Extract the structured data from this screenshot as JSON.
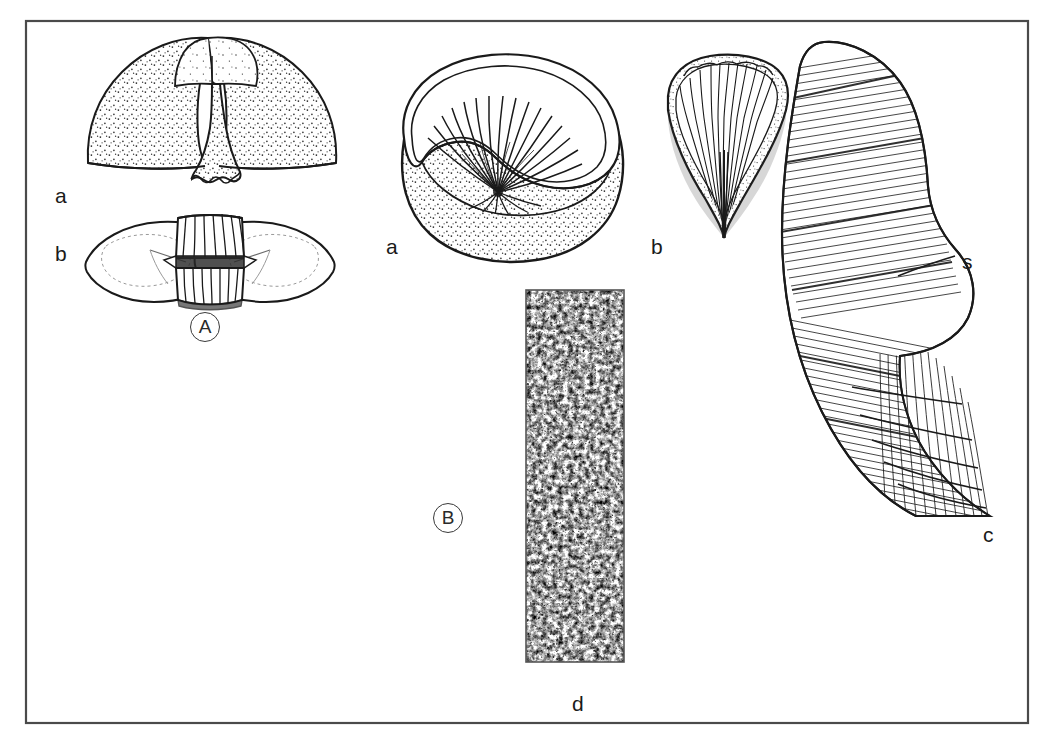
{
  "plate": {
    "background_color": "#ffffff",
    "ink_color": "#1a1a1a",
    "frame_color": "#4a4a4a",
    "frame": {
      "x": 26,
      "y": 21,
      "width": 1002,
      "height": 702
    }
  },
  "groups": [
    {
      "id": "group-a",
      "label": "A",
      "cx": 205,
      "cy": 327
    },
    {
      "id": "group-b",
      "label": "B",
      "cx": 448,
      "cy": 518
    }
  ],
  "labels": [
    {
      "id": "label-a-dorsal",
      "text": "a",
      "x": 55,
      "y": 185,
      "group": "A",
      "desc": "dorsal-view"
    },
    {
      "id": "label-a-ventral",
      "text": "b",
      "x": 55,
      "y": 243,
      "group": "A",
      "desc": "ventral-view"
    },
    {
      "id": "label-b-apertural",
      "text": "a",
      "x": 386,
      "y": 236,
      "group": "B",
      "desc": "apertural-view"
    },
    {
      "id": "label-b-lateral",
      "text": "b",
      "x": 651,
      "y": 236,
      "group": "B",
      "desc": "lateral-view"
    },
    {
      "id": "label-b-detail",
      "text": "c",
      "x": 983,
      "y": 524,
      "group": "B",
      "desc": "shell-structure-detail"
    },
    {
      "id": "label-b-section",
      "text": "d",
      "x": 572,
      "y": 693,
      "group": "B",
      "desc": "thin-section"
    },
    {
      "id": "label-septum",
      "text": "s",
      "x": 962,
      "y": 251,
      "group": "B",
      "desc": "septum-pointer"
    }
  ],
  "figures": [
    {
      "id": "fig-a-dorsal",
      "name": "specimen-a-dorsal-view",
      "bbox": [
        72,
        36,
        280,
        150
      ]
    },
    {
      "id": "fig-a-ventral",
      "name": "specimen-a-ventral-view",
      "bbox": [
        85,
        216,
        250,
        92
      ]
    },
    {
      "id": "fig-b-apertural",
      "name": "specimen-b-apertural-view",
      "bbox": [
        400,
        38,
        225,
        200
      ]
    },
    {
      "id": "fig-b-lateral",
      "name": "specimen-b-lateral-view",
      "bbox": [
        664,
        52,
        125,
        188
      ]
    },
    {
      "id": "fig-b-detail",
      "name": "specimen-b-shell-structure",
      "bbox": [
        776,
        38,
        215,
        478
      ]
    },
    {
      "id": "fig-b-section",
      "name": "specimen-b-thin-section",
      "bbox": [
        526,
        290,
        98,
        372
      ]
    }
  ],
  "thin_section": {
    "rect": {
      "x": 526,
      "y": 290,
      "width": 98,
      "height": 372
    },
    "border_color": "#555555",
    "fill": "stippled-texture"
  },
  "pointer_lines": [
    {
      "id": "septum-leader",
      "from": [
        898,
        276
      ],
      "to": [
        955,
        256
      ]
    }
  ]
}
